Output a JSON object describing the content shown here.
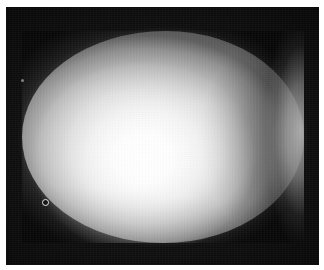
{
  "figure": {
    "caption": "",
    "background_color": "#0d0d0d",
    "page_margin_color": "#ffffff",
    "width_px": 324,
    "height_px": 270
  },
  "subject": {
    "label": "egg",
    "description": "Ovoid specimen, blunt end at left, tapered end at right",
    "center_x_px": 163,
    "center_y_px": 137,
    "width_px": 282,
    "height_px": 212,
    "base_tone": "#b9b9b9",
    "highlight_color": "#ffffff",
    "shadow_color": "#6e6e6e"
  },
  "shading": {
    "highlight_label": "diffuse highlight",
    "highlight_center_x_pct": 43,
    "highlight_center_y_pct": 60,
    "crescent_label": "attached shadow crescent",
    "crescent_side": "right",
    "rimlight_label": "reflected rim light",
    "rimlight_side": "right-edge"
  },
  "markers": [
    {
      "name": "reference-ring-marker",
      "kind": "ring",
      "x_px": 42,
      "y_px": 199,
      "size_px": 7
    },
    {
      "name": "dust-speck",
      "kind": "speck",
      "x_px": 21,
      "y_px": 79,
      "size_px": 3
    }
  ]
}
